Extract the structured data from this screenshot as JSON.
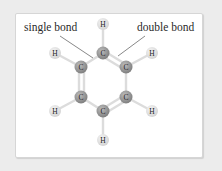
{
  "labels": {
    "single_bond": "single bond",
    "double_bond": "double bond"
  },
  "atoms": {
    "carbon_symbol": "C",
    "hydrogen_symbol": "H"
  },
  "colors": {
    "carbon": "#8a8a8a",
    "hydrogen": "#e2e2e2",
    "bond": "#dcdcdc",
    "pointer": "#555555",
    "background": "#ececec",
    "card": "#ffffff"
  }
}
